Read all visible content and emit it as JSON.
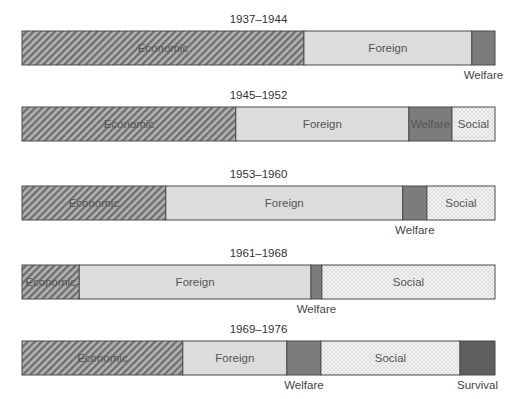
{
  "chart_data": {
    "type": "bar",
    "orientation": "horizontal-stacked-percent",
    "title": "",
    "xlabel": "",
    "ylabel": "",
    "xlim": [
      0,
      100
    ],
    "unit": "percent of total",
    "grid": false,
    "legend": "none (segments labeled inline)",
    "categories": [
      "Economic",
      "Foreign",
      "Welfare",
      "Social",
      "Survival"
    ],
    "category_styles": {
      "Economic": {
        "fill": "#9a9a9a",
        "pattern": "diagonal-hatch"
      },
      "Foreign": {
        "fill": "#dcdcdc",
        "pattern": "none"
      },
      "Welfare": {
        "fill": "#7c7c7c",
        "pattern": "none"
      },
      "Social": {
        "fill": "#efefef",
        "pattern": "crosshatch"
      },
      "Survival": {
        "fill": "#5e5e5e",
        "pattern": "none"
      }
    },
    "bars": [
      {
        "period": "1937–1944",
        "segments": [
          {
            "category": "Economic",
            "value": 59.6,
            "label": "Economic",
            "label_pos": "inside"
          },
          {
            "category": "Foreign",
            "value": 35.5,
            "label": "Foreign",
            "label_pos": "inside"
          },
          {
            "category": "Welfare",
            "value": 4.9,
            "label": "Welfare",
            "label_pos": "below"
          }
        ]
      },
      {
        "period": "1945–1952",
        "segments": [
          {
            "category": "Economic",
            "value": 45.2,
            "label": "Economic",
            "label_pos": "inside"
          },
          {
            "category": "Foreign",
            "value": 36.6,
            "label": "Foreign",
            "label_pos": "inside"
          },
          {
            "category": "Welfare",
            "value": 9.1,
            "label": "Welfare",
            "label_pos": "inside"
          },
          {
            "category": "Social",
            "value": 9.1,
            "label": "Social",
            "label_pos": "inside"
          }
        ]
      },
      {
        "period": "1953–1960",
        "segments": [
          {
            "category": "Economic",
            "value": 30.4,
            "label": "Economic",
            "label_pos": "inside"
          },
          {
            "category": "Foreign",
            "value": 50.1,
            "label": "Foreign",
            "label_pos": "inside"
          },
          {
            "category": "Welfare",
            "value": 5.1,
            "label": "Welfare",
            "label_pos": "below"
          },
          {
            "category": "Social",
            "value": 14.4,
            "label": "Social",
            "label_pos": "inside"
          }
        ]
      },
      {
        "period": "1961–1968",
        "segments": [
          {
            "category": "Economic",
            "value": 12.1,
            "label": "Economic",
            "label_pos": "inside"
          },
          {
            "category": "Foreign",
            "value": 49.0,
            "label": "Foreign",
            "label_pos": "inside"
          },
          {
            "category": "Welfare",
            "value": 2.3,
            "label": "Welfare",
            "label_pos": "below"
          },
          {
            "category": "Social",
            "value": 36.6,
            "label": "Social",
            "label_pos": "inside"
          }
        ]
      },
      {
        "period": "1969–1976",
        "segments": [
          {
            "category": "Economic",
            "value": 34.0,
            "label": "Economic",
            "label_pos": "inside"
          },
          {
            "category": "Foreign",
            "value": 22.0,
            "label": "Foreign",
            "label_pos": "inside"
          },
          {
            "category": "Welfare",
            "value": 7.2,
            "label": "Welfare",
            "label_pos": "below"
          },
          {
            "category": "Social",
            "value": 29.4,
            "label": "Social",
            "label_pos": "inside"
          },
          {
            "category": "Survival",
            "value": 7.4,
            "label": "Survival",
            "label_pos": "below"
          }
        ]
      }
    ]
  }
}
